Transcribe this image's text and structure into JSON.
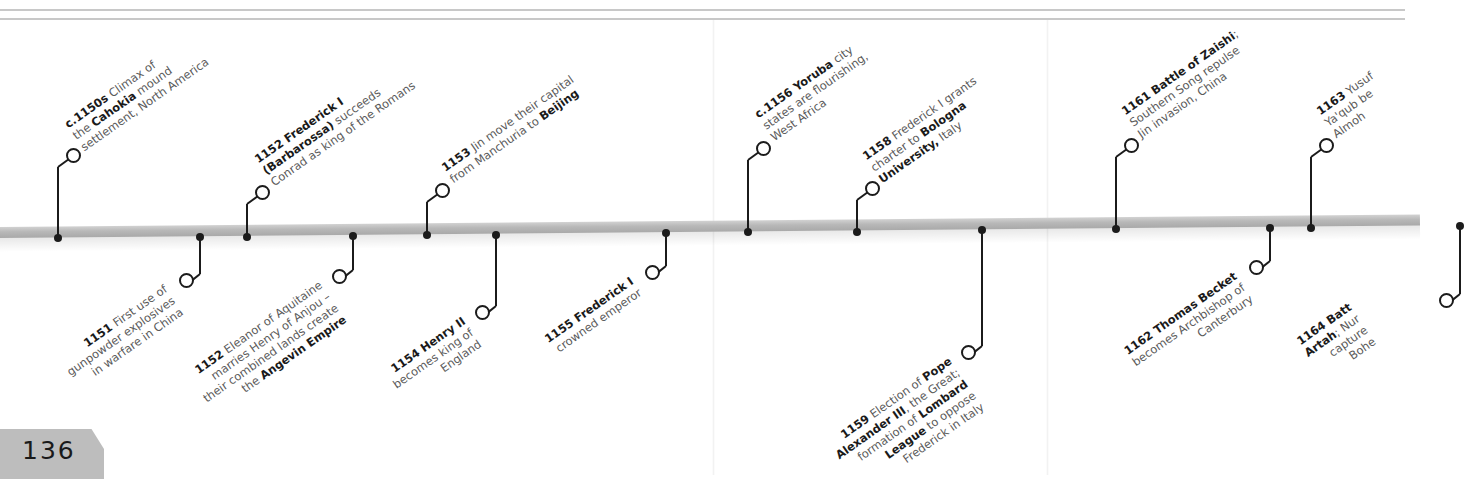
{
  "page": {
    "number": "136"
  },
  "colors": {
    "ink": "#1a1a1a",
    "text_gray": "#5a5a5a",
    "bar": "#b8b8b8",
    "rule": "#c8c8c8",
    "tab": "#bdbdbd"
  },
  "timeline": {
    "events_above": [
      {
        "id": "e1150s",
        "lines": [
          [
            "c.1150s",
            " Climax of"
          ],
          [
            "the ",
            "Cahokia",
            " mound"
          ],
          [
            "settlement, North America"
          ]
        ],
        "date": "c.1150s"
      },
      {
        "id": "e1152a",
        "lines": [
          [
            "1152 Frederick I"
          ],
          [
            "(Barbarossa)",
            " succeeds"
          ],
          [
            "Conrad as king of the Romans"
          ]
        ],
        "date": "1152"
      },
      {
        "id": "e1153",
        "lines": [
          [
            "1153",
            " Jin move their capital"
          ],
          [
            "from Manchuria to ",
            "Beijing"
          ]
        ],
        "date": "1153"
      },
      {
        "id": "e1156",
        "lines": [
          [
            "c.1156 Yoruba",
            " city"
          ],
          [
            "states are flourishing,"
          ],
          [
            "West Africa"
          ]
        ],
        "date": "c.1156"
      },
      {
        "id": "e1158",
        "lines": [
          [
            "1158",
            " Frederick I grants"
          ],
          [
            "charter to ",
            "Bologna"
          ],
          [
            "University,",
            " Italy"
          ]
        ],
        "date": "1158"
      },
      {
        "id": "e1161",
        "lines": [
          [
            "1161 Battle of Zaishi",
            ";"
          ],
          [
            "Southern Song repulse"
          ],
          [
            "Jin invasion, China"
          ]
        ],
        "date": "1161"
      },
      {
        "id": "e1163",
        "lines": [
          [
            "1163",
            " Yusuf"
          ],
          [
            "Ya'qub be"
          ],
          [
            "Almoh"
          ]
        ],
        "date": "1163"
      }
    ],
    "events_below": [
      {
        "id": "e1151",
        "lines": [
          [
            "1151",
            " First use of"
          ],
          [
            "gunpowder ",
            "explosives"
          ],
          [
            "in warfare in China"
          ]
        ],
        "date": "1151"
      },
      {
        "id": "e1152b",
        "lines": [
          [
            "1152",
            " Eleanor of Aquitaine"
          ],
          [
            "marries Henry of Anjou –"
          ],
          [
            "their combined lands create"
          ],
          [
            "the ",
            "Angevin Empire"
          ]
        ],
        "date": "1152"
      },
      {
        "id": "e1154",
        "lines": [
          [
            "1154 Henry II"
          ],
          [
            "becomes king of"
          ],
          [
            "England"
          ]
        ],
        "date": "1154"
      },
      {
        "id": "e1155",
        "lines": [
          [
            "1155 Frederick I"
          ],
          [
            "crowned emperor"
          ]
        ],
        "date": "1155"
      },
      {
        "id": "e1159",
        "lines": [
          [
            "1159",
            " Election of ",
            "Pope"
          ],
          [
            "Alexander III",
            ", the Great;"
          ],
          [
            "formation of ",
            "Lombard"
          ],
          [
            "League",
            " to oppose"
          ],
          [
            "Frederick in Italy"
          ]
        ],
        "date": "1159"
      },
      {
        "id": "e1162",
        "lines": [
          [
            "1162 Thomas Becket"
          ],
          [
            "becomes Archbishop of"
          ],
          [
            "Canterbury"
          ]
        ],
        "date": "1162"
      },
      {
        "id": "e1164",
        "lines": [
          [
            "1164 Batt"
          ],
          [
            "Artah",
            "; Nur"
          ],
          [
            "capture"
          ],
          [
            "Bohe"
          ]
        ],
        "date": "1164"
      }
    ]
  }
}
